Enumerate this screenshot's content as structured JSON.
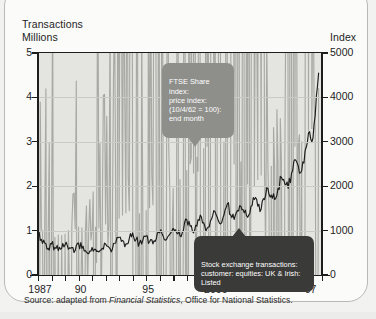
{
  "figure": {
    "left_axis_title_line1": "Transactions",
    "left_axis_title_line2": "Millions",
    "right_axis_title": "Index",
    "source_prefix": "Source: adapted from ",
    "source_italic": "Financial Statistics",
    "source_suffix": ", Office for National Statistics."
  },
  "callouts": {
    "ftse": "FTSE Share index:\nprice index:\n(10/4/62 = 100):\nend month",
    "transactions": "Stock exchange transactions:\ncustomer: equities: UK & Irish:\nListed"
  },
  "colors": {
    "plot_background": "#e4e4e1",
    "gridline": "#c9c9c5",
    "axis": "#1d1d1d",
    "series_transactions": "#1d1d1d",
    "series_ftse": "#a9a9a4",
    "callout_ftse_bg": "#8e8e8b",
    "callout_transactions_bg": "#3a3a38",
    "card_background": "#fbfbfa",
    "card_border": "#b9b9b4"
  },
  "chart_data": {
    "type": "line",
    "title": "",
    "xlabel": "",
    "ylabel": "Transactions Millions",
    "y2label": "Index",
    "ylim": [
      0,
      5
    ],
    "y2lim": [
      0,
      5000
    ],
    "xlim": [
      1987,
      2008
    ],
    "grid": true,
    "legend": "annotations",
    "yticks": [
      0,
      1,
      2,
      3,
      4,
      5
    ],
    "y2ticks": [
      0,
      1000,
      2000,
      3000,
      4000,
      5000
    ],
    "xticks": [
      1987,
      1988,
      1989,
      1990,
      1991,
      1992,
      1993,
      1994,
      1995,
      1996,
      1997,
      1998,
      1999,
      2000,
      2001,
      2002,
      2003,
      2004,
      2005,
      2006,
      2007,
      2008
    ],
    "xticklabels": [
      {
        "x": 1987,
        "label": "1987"
      },
      {
        "x": 1990,
        "label": "90"
      },
      {
        "x": 1995,
        "label": "95"
      },
      {
        "x": 2000,
        "label": "2000"
      },
      {
        "x": 2007,
        "label": "07"
      }
    ],
    "series": [
      {
        "name": "Stock exchange transactions: customer: equities: UK & Irish: Listed",
        "axis": "left",
        "unit": "millions",
        "color": "#1d1d1d",
        "x": [
          1987.0,
          1987.25,
          1987.5,
          1987.75,
          1988.0,
          1988.25,
          1988.5,
          1988.75,
          1989.0,
          1989.25,
          1989.5,
          1989.75,
          1990.0,
          1990.25,
          1990.5,
          1990.75,
          1991.0,
          1991.25,
          1991.5,
          1991.75,
          1992.0,
          1992.25,
          1992.5,
          1992.75,
          1993.0,
          1993.25,
          1993.5,
          1993.75,
          1994.0,
          1994.25,
          1994.5,
          1994.75,
          1995.0,
          1995.25,
          1995.5,
          1995.75,
          1996.0,
          1996.25,
          1996.5,
          1996.75,
          1997.0,
          1997.25,
          1997.5,
          1997.75,
          1998.0,
          1998.25,
          1998.5,
          1998.75,
          1999.0,
          1999.25,
          1999.5,
          1999.75,
          2000.0,
          2000.25,
          2000.5,
          2000.75,
          2001.0,
          2001.25,
          2001.5,
          2001.75,
          2002.0,
          2002.25,
          2002.5,
          2002.75,
          2003.0,
          2003.25,
          2003.5,
          2003.75,
          2004.0,
          2004.25,
          2004.5,
          2004.75,
          2005.0,
          2005.25,
          2005.5,
          2005.75,
          2006.0,
          2006.25,
          2006.5,
          2006.75,
          2007.0,
          2007.25,
          2007.5,
          2007.75
        ],
        "y": [
          0.95,
          0.8,
          0.72,
          0.6,
          0.7,
          0.62,
          0.55,
          0.6,
          0.68,
          0.58,
          0.62,
          0.55,
          0.72,
          0.6,
          0.55,
          0.48,
          0.62,
          0.58,
          0.52,
          0.6,
          0.7,
          0.62,
          0.58,
          0.72,
          0.85,
          0.78,
          0.7,
          0.82,
          0.95,
          0.8,
          0.72,
          0.78,
          0.88,
          0.75,
          0.7,
          0.82,
          0.95,
          0.88,
          0.8,
          0.92,
          1.05,
          0.95,
          0.88,
          1.0,
          1.25,
          1.1,
          0.95,
          1.1,
          1.35,
          1.18,
          1.05,
          1.22,
          1.45,
          1.3,
          1.15,
          1.35,
          1.6,
          1.35,
          1.25,
          1.45,
          1.55,
          1.4,
          1.3,
          1.55,
          1.7,
          1.55,
          1.48,
          1.7,
          1.95,
          1.8,
          1.7,
          1.95,
          2.2,
          2.05,
          1.95,
          2.3,
          2.6,
          2.45,
          2.35,
          2.8,
          3.2,
          3.0,
          3.6,
          4.55
        ]
      },
      {
        "name": "FTSE Share index: price index: (10/4/62 = 100): end month",
        "axis": "right",
        "unit": "index",
        "color": "#a9a9a4",
        "x": [
          1987.0,
          1987.25,
          1987.5,
          1987.75,
          1988.0,
          1988.25,
          1988.5,
          1988.75,
          1989.0,
          1989.25,
          1989.5,
          1989.75,
          1990.0,
          1990.25,
          1990.5,
          1990.75,
          1991.0,
          1991.25,
          1991.5,
          1991.75,
          1992.0,
          1992.25,
          1992.5,
          1992.75,
          1993.0,
          1993.25,
          1993.5,
          1993.75,
          1994.0,
          1994.25,
          1994.5,
          1994.75,
          1995.0,
          1995.25,
          1995.5,
          1995.75,
          1996.0,
          1996.25,
          1996.5,
          1996.75,
          1997.0,
          1997.25,
          1997.5,
          1997.75,
          1998.0,
          1998.25,
          1998.5,
          1998.75,
          1999.0,
          1999.25,
          1999.5,
          1999.75,
          2000.0,
          2000.25,
          2000.5,
          2000.75,
          2001.0,
          2001.25,
          2001.5,
          2001.75,
          2002.0,
          2002.25,
          2002.5,
          2002.75,
          2003.0,
          2003.25,
          2003.5,
          2003.75,
          2004.0,
          2004.25,
          2004.5,
          2004.75,
          2005.0,
          2005.25,
          2005.5,
          2005.75,
          2006.0,
          2006.25,
          2006.5,
          2006.75,
          2007.0,
          2007.25,
          2007.5,
          2007.75
        ],
        "y": [
          900,
          1050,
          1150,
          780,
          820,
          850,
          900,
          890,
          920,
          1000,
          1060,
          1040,
          1080,
          1060,
          950,
          1000,
          1020,
          1080,
          1060,
          1100,
          1150,
          1130,
          1180,
          1250,
          1280,
          1350,
          1400,
          1450,
          1500,
          1420,
          1380,
          1420,
          1450,
          1520,
          1580,
          1620,
          1680,
          1720,
          1780,
          1850,
          1950,
          2050,
          2150,
          2200,
          2350,
          2500,
          2300,
          2650,
          2750,
          2850,
          2900,
          3050,
          3200,
          3150,
          3050,
          3000,
          2900,
          2750,
          2500,
          2450,
          2550,
          2300,
          2050,
          2150,
          2000,
          2150,
          2250,
          2350,
          2400,
          2450,
          2400,
          2500,
          2550,
          2600,
          2700,
          2800,
          2900,
          2950,
          3000,
          3150,
          3250,
          3300,
          3350,
          4200
        ]
      }
    ],
    "annotations": [
      {
        "text": "FTSE Share index: price index: (10/4/62 = 100): end month",
        "points_to_series": "FTSE Share index",
        "points_to_x": 2000
      },
      {
        "text": "Stock exchange transactions: customer: equities: UK & Irish: Listed",
        "points_to_series": "Stock exchange transactions",
        "points_to_x": 2003
      }
    ]
  }
}
